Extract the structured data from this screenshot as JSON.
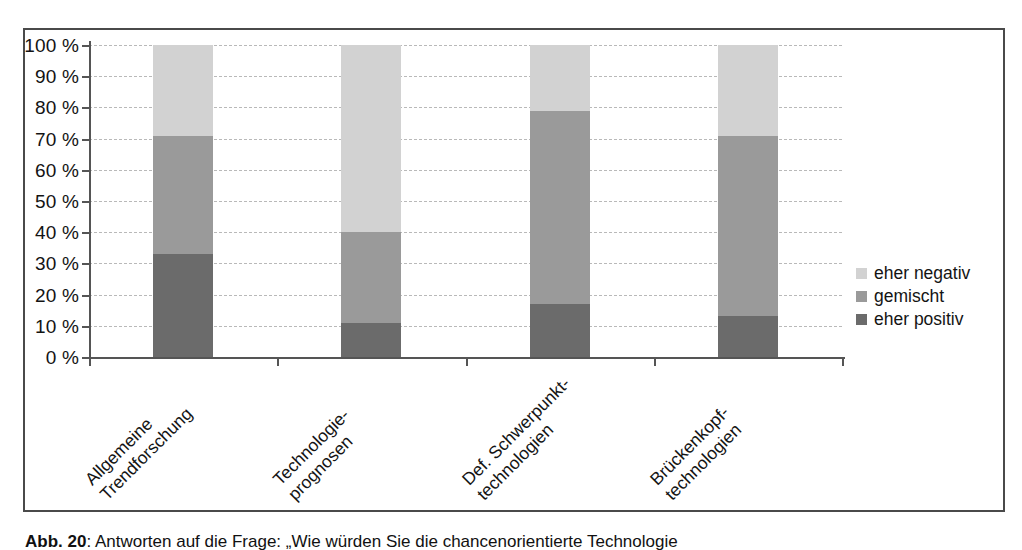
{
  "chart_data": {
    "type": "bar",
    "subtype": "stacked-bar-100-percent",
    "title": "",
    "xlabel": "",
    "ylabel": "",
    "ylim": [
      0,
      100
    ],
    "y_unit": "%",
    "grid": true,
    "legend_position": "right",
    "categories": [
      "Allgemeine Trendforschung",
      "Technologie-prognosen",
      "Def. Schwerpunkt-technologien",
      "Brückenkopf-technologien"
    ],
    "category_lines": [
      [
        "Allgemeine",
        "Trendforschung"
      ],
      [
        "Technologie-",
        "prognosen"
      ],
      [
        "Def. Schwerpunkt-",
        "technologien"
      ],
      [
        "Brückenkopf-",
        "technologien"
      ]
    ],
    "series": [
      {
        "name": "eher positiv",
        "color": "#6b6b6b",
        "values": [
          33,
          11,
          17,
          13
        ]
      },
      {
        "name": "gemischt",
        "color": "#9a9a9a",
        "values": [
          38,
          29,
          62,
          58
        ]
      },
      {
        "name": "eher negativ",
        "color": "#d2d2d2",
        "values": [
          29,
          60,
          21,
          29
        ]
      }
    ],
    "cumulative_tops": {
      "eher positiv": [
        33,
        11,
        17,
        13
      ],
      "gemischt": [
        71,
        40,
        79,
        71
      ],
      "eher negativ": [
        100,
        100,
        100,
        100
      ]
    },
    "y_ticks": [
      {
        "value": 100,
        "label": "100 %"
      },
      {
        "value": 90,
        "label": "90 %"
      },
      {
        "value": 80,
        "label": "80 %"
      },
      {
        "value": 70,
        "label": "70 %"
      },
      {
        "value": 60,
        "label": "60 %"
      },
      {
        "value": 50,
        "label": "50 %"
      },
      {
        "value": 40,
        "label": "40 %"
      },
      {
        "value": 30,
        "label": "30 %"
      },
      {
        "value": 20,
        "label": "20 %"
      },
      {
        "value": 10,
        "label": "10 %"
      },
      {
        "value": 0,
        "label": "0 %"
      }
    ],
    "legend": [
      {
        "label": "eher negativ",
        "color": "#d2d2d2"
      },
      {
        "label": "gemischt",
        "color": "#9a9a9a"
      },
      {
        "label": "eher positiv",
        "color": "#6b6b6b"
      }
    ]
  },
  "caption": {
    "number": "Abb. 20",
    "separator": ": ",
    "text": "Antworten auf die Frage: „Wie würden Sie die chancenorientierte Technologie"
  }
}
